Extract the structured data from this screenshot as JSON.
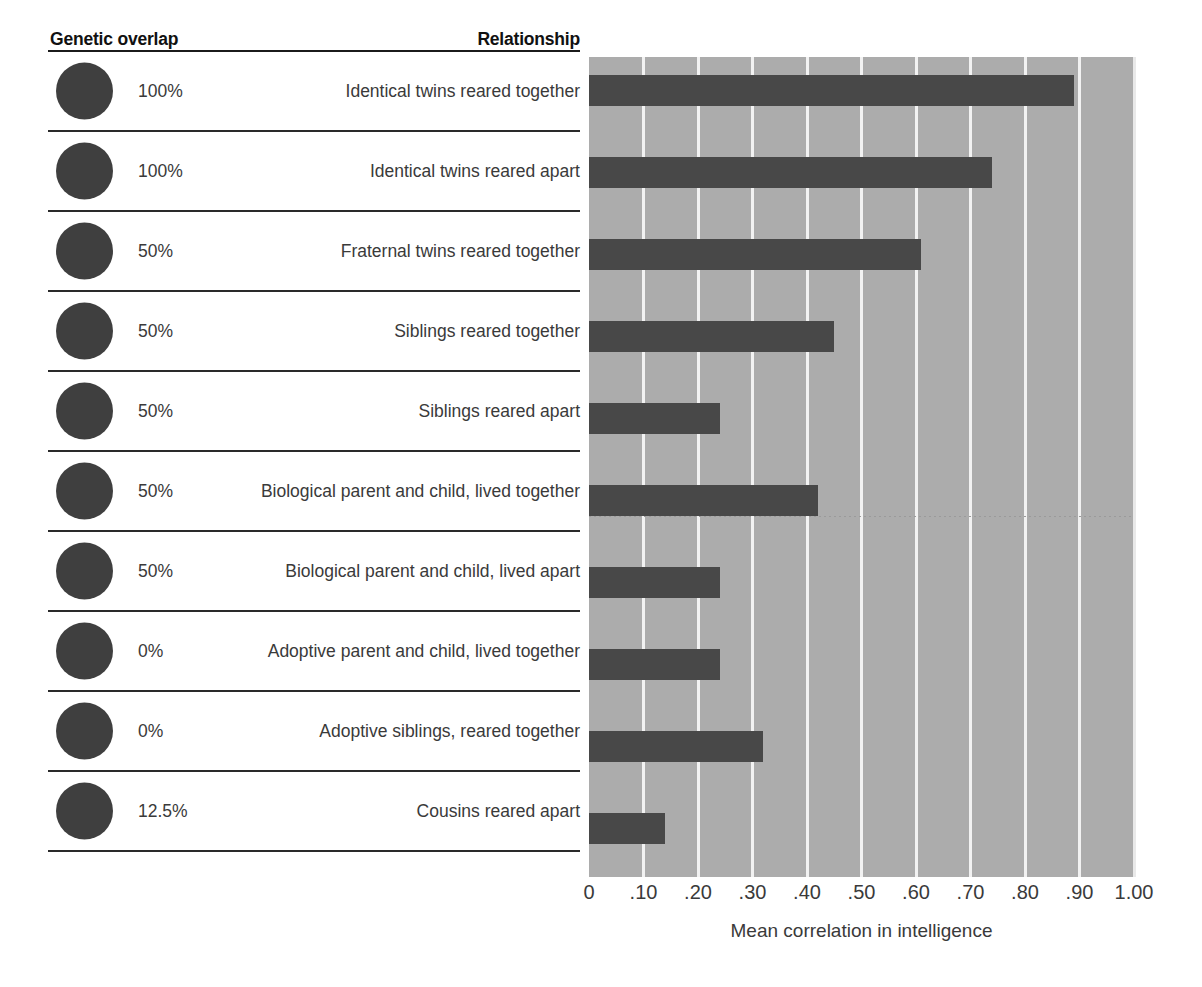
{
  "headers": {
    "genetic_overlap": "Genetic overlap",
    "relationship": "Relationship"
  },
  "rows": [
    {
      "genetic_overlap": "100%",
      "relationship": "Identical twins reared together",
      "value": 0.89
    },
    {
      "genetic_overlap": "100%",
      "relationship": "Identical twins reared apart",
      "value": 0.74
    },
    {
      "genetic_overlap": "50%",
      "relationship": "Fraternal twins reared together",
      "value": 0.61
    },
    {
      "genetic_overlap": "50%",
      "relationship": "Siblings reared together",
      "value": 0.45
    },
    {
      "genetic_overlap": "50%",
      "relationship": "Siblings reared apart",
      "value": 0.24
    },
    {
      "genetic_overlap": "50%",
      "relationship": "Biological parent and child, lived together",
      "value": 0.42
    },
    {
      "genetic_overlap": "50%",
      "relationship": "Biological parent and child, lived apart",
      "value": 0.24
    },
    {
      "genetic_overlap": "0%",
      "relationship": "Adoptive parent and child, lived together",
      "value": 0.24
    },
    {
      "genetic_overlap": "0%",
      "relationship": "Adoptive siblings, reared together",
      "value": 0.32
    },
    {
      "genetic_overlap": "12.5%",
      "relationship": "Cousins reared apart",
      "value": 0.14
    }
  ],
  "chart_data": {
    "type": "bar",
    "orientation": "horizontal",
    "title": "",
    "xlabel": "Mean correlation in intelligence",
    "ylabel": "",
    "xlim": [
      0,
      1.0
    ],
    "grid": true,
    "legend": "none",
    "tick_labels": [
      "0",
      ".10",
      ".20",
      ".30",
      ".40",
      ".50",
      ".60",
      ".70",
      ".80",
      ".90",
      "1.00"
    ],
    "tick_values": [
      0,
      0.1,
      0.2,
      0.3,
      0.4,
      0.5,
      0.6,
      0.7,
      0.8,
      0.9,
      1.0
    ],
    "categories": [
      "Identical twins reared together",
      "Identical twins reared apart",
      "Fraternal twins reared together",
      "Siblings reared together",
      "Siblings reared apart",
      "Biological parent and child, lived together",
      "Biological parent and child, lived apart",
      "Adoptive parent and child, lived together",
      "Adoptive siblings, reared together",
      "Cousins reared apart"
    ],
    "values": [
      0.89,
      0.74,
      0.61,
      0.45,
      0.24,
      0.42,
      0.24,
      0.24,
      0.32,
      0.14
    ],
    "genetic_overlap": [
      "100%",
      "100%",
      "50%",
      "50%",
      "50%",
      "50%",
      "50%",
      "0%",
      "0%",
      "12.5%"
    ]
  },
  "colors": {
    "bar": "#484848",
    "plot_background": "#acacac",
    "gridline": "#f2f2f2",
    "dot": "#3f3f3f",
    "text": "#3a3a3a",
    "header_text": "#111111",
    "rule": "#1b1b1b",
    "page_background": "#ffffff"
  }
}
